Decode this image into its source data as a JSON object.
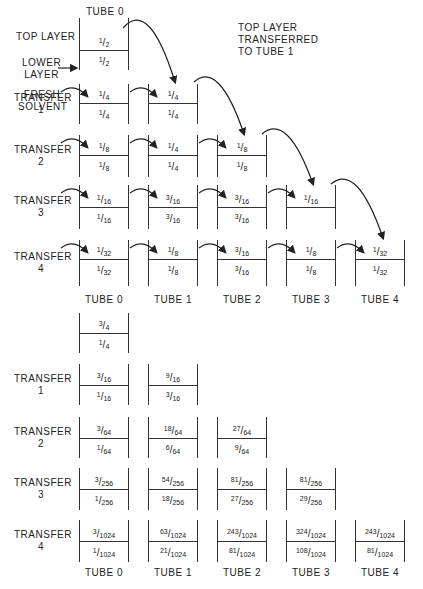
{
  "top_section": {
    "title_tube0": "TUBE 0",
    "annotation": [
      "TOP LAYER",
      "TRANSFERRED",
      "TO TUBE 1"
    ],
    "labels": {
      "top_layer": "TOP LAYER",
      "lower_layer": [
        "LOWER",
        "LAYER"
      ],
      "fresh_solvent": [
        "FRESH",
        "SOLVENT"
      ]
    },
    "rows": [
      {
        "label": [],
        "tubes": [
          {
            "top": "1/2",
            "bottom": "1/2"
          }
        ]
      },
      {
        "label": [
          "TRANSFER",
          "1"
        ],
        "tubes": [
          {
            "top": "1/4",
            "bottom": "1/4"
          },
          {
            "top": "1/4",
            "bottom": "1/4"
          }
        ]
      },
      {
        "label": [
          "TRANSFER",
          "2"
        ],
        "tubes": [
          {
            "top": "1/8",
            "bottom": "1/8"
          },
          {
            "top": "1/4",
            "bottom": "1/4"
          },
          {
            "top": "1/8",
            "bottom": "1/8"
          }
        ]
      },
      {
        "label": [
          "TRANSFER",
          "3"
        ],
        "tubes": [
          {
            "top": "1/16",
            "bottom": "1/16"
          },
          {
            "top": "3/16",
            "bottom": "3/16"
          },
          {
            "top": "3/16",
            "bottom": "3/16"
          },
          {
            "top": "1/16",
            "bottom": ""
          }
        ]
      },
      {
        "label": [
          "TRANSFER",
          "4"
        ],
        "tubes": [
          {
            "top": "1/32",
            "bottom": "1/32"
          },
          {
            "top": "1/8",
            "bottom": "1/8"
          },
          {
            "top": "3/16",
            "bottom": "3/16"
          },
          {
            "top": "1/8",
            "bottom": "1/8"
          },
          {
            "top": "1/32",
            "bottom": "1/32"
          }
        ]
      }
    ],
    "tube_names": [
      "TUBE 0",
      "TUBE 1",
      "TUBE 2",
      "TUBE 3",
      "TUBE 4"
    ]
  },
  "bottom_section": {
    "rows": [
      {
        "label": [],
        "tubes": [
          {
            "top": "3/4",
            "bottom": "1/4"
          }
        ]
      },
      {
        "label": [
          "TRANSFER",
          "1"
        ],
        "tubes": [
          {
            "top": "3/16",
            "bottom": "1/16"
          },
          {
            "top": "9/16",
            "bottom": "3/16"
          }
        ]
      },
      {
        "label": [
          "TRANSFER",
          "2"
        ],
        "tubes": [
          {
            "top": "3/64",
            "bottom": "1/64"
          },
          {
            "top": "18/64",
            "bottom": "6/64"
          },
          {
            "top": "27/64",
            "bottom": "9/64"
          }
        ]
      },
      {
        "label": [
          "TRANSFER",
          "3"
        ],
        "tubes": [
          {
            "top": "3/256",
            "bottom": "1/256"
          },
          {
            "top": "54/256",
            "bottom": "18/256"
          },
          {
            "top": "81/256",
            "bottom": "27/256"
          },
          {
            "top": "81/256",
            "bottom": "29/256"
          }
        ]
      },
      {
        "label": [
          "TRANSFER",
          "4"
        ],
        "tubes": [
          {
            "top": "3/1024",
            "bottom": "1/1024"
          },
          {
            "top": "63/1024",
            "bottom": "21/1024"
          },
          {
            "top": "243/1024",
            "bottom": "81/1024"
          },
          {
            "top": "324/1024",
            "bottom": "108/1024"
          },
          {
            "top": "243/1024",
            "bottom": "81/1024"
          }
        ]
      }
    ],
    "tube_names": [
      "TUBE 0",
      "TUBE 1",
      "TUBE 2",
      "TUBE 3",
      "TUBE 4"
    ]
  }
}
